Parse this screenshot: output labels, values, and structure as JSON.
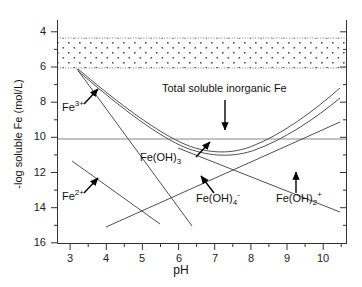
{
  "chart_data": {
    "type": "line",
    "title": "",
    "xlabel": "pH",
    "ylabel": "-log soluble Fe (mol/L)",
    "xlim": [
      2.5,
      10.7
    ],
    "ylim_inverted": true,
    "ylim": [
      4,
      16
    ],
    "grid": false,
    "legend_position": "none",
    "x_ticks": [
      3,
      4,
      5,
      6,
      7,
      8,
      9,
      10
    ],
    "x_tick_labels": [
      "3",
      "4",
      "5",
      "6",
      "7",
      "8",
      "9",
      "10"
    ],
    "x_minor_ticks": [
      2.5,
      3.5,
      4.5,
      5.5,
      6.5,
      7.5,
      8.5,
      9.5,
      10.5
    ],
    "y_ticks": [
      4,
      6,
      8,
      10,
      12,
      14,
      16
    ],
    "y_tick_labels": [
      "4",
      "6",
      "8",
      "10",
      "12",
      "14",
      "16"
    ],
    "y_minor_ticks": [
      5,
      7,
      9,
      11,
      13,
      15
    ],
    "shaded_band": {
      "label": "dotted region",
      "y_top": 4.5,
      "y_bottom": 6.2,
      "x_start": 2.5,
      "x_end": 10.7,
      "fill_pattern": "dots",
      "fill_color": "#ffffff",
      "dot_color": "#555555"
    },
    "series": [
      {
        "name": "Total soluble inorganic Fe (upper)",
        "points": [
          [
            3.1,
            6.1
          ],
          [
            4.0,
            7.25
          ],
          [
            5.0,
            8.4
          ],
          [
            6.0,
            9.3
          ],
          [
            7.0,
            10.0
          ],
          [
            7.6,
            10.25
          ],
          [
            8.0,
            10.3
          ],
          [
            8.6,
            10.0
          ],
          [
            9.2,
            9.3
          ],
          [
            9.8,
            8.4
          ],
          [
            10.4,
            7.4
          ]
        ]
      },
      {
        "name": "Total soluble inorganic Fe (lower)",
        "points": [
          [
            3.1,
            6.15
          ],
          [
            4.0,
            7.45
          ],
          [
            5.0,
            8.65
          ],
          [
            6.0,
            9.6
          ],
          [
            7.0,
            10.2
          ],
          [
            7.6,
            10.45
          ],
          [
            8.0,
            10.5
          ],
          [
            8.6,
            10.25
          ],
          [
            9.2,
            9.7
          ],
          [
            9.8,
            8.9
          ],
          [
            10.4,
            8.0
          ]
        ]
      },
      {
        "name": "Fe(3+)",
        "points": [
          [
            3.1,
            6.1
          ],
          [
            6.3,
            15.0
          ]
        ]
      },
      {
        "name": "Fe(OH)3 saturation",
        "points": [
          [
            2.5,
            10.3
          ],
          [
            10.7,
            10.3
          ]
        ]
      },
      {
        "name": "Fe(2+)",
        "points": [
          [
            3.05,
            11.3
          ],
          [
            5.5,
            14.9
          ]
        ]
      },
      {
        "name": "Fe(OH)4-",
        "points": [
          [
            4.0,
            14.95
          ],
          [
            10.4,
            9.0
          ]
        ]
      },
      {
        "name": "Fe(OH)2+",
        "points": [
          [
            6.0,
            9.6
          ],
          [
            10.4,
            13.2
          ]
        ]
      }
    ],
    "annotations": [
      {
        "id": "fe3",
        "text_html": "Fe<sup>3+</sup>",
        "label_x": 62,
        "label_y": 106,
        "arrow_from": [
          84,
          104
        ],
        "arrow_to": [
          98,
          88
        ]
      },
      {
        "id": "fe2",
        "text_html": "Fe<sup>2+</sup>",
        "label_x": 62,
        "label_y": 195,
        "arrow_from": [
          84,
          193
        ],
        "arrow_to": [
          98,
          177
        ]
      },
      {
        "id": "total",
        "text_html": "Total soluble inorganic Fe",
        "label_x": 162,
        "label_y": 88,
        "arrow_from": [
          225,
          100
        ],
        "arrow_to": [
          225,
          132
        ]
      },
      {
        "id": "feoh3",
        "text_html": "Fe(OH)<sub>3</sub>",
        "label_x": 140,
        "label_y": 158,
        "arrow_from": [
          196,
          157
        ],
        "arrow_to": [
          210,
          141
        ]
      },
      {
        "id": "feoh4",
        "text_html": "Fe(OH)<sub>4</sub><sup>-</sup>",
        "label_x": 198,
        "label_y": 197,
        "arrow_from": [
          214,
          194
        ],
        "arrow_to": [
          200,
          175
        ]
      },
      {
        "id": "feoh2",
        "text_html": "Fe(OH)<sub>2</sub><sup>+</sup>",
        "label_x": 278,
        "label_y": 197,
        "arrow_from": [
          296,
          194
        ],
        "arrow_to": [
          296,
          172
        ]
      }
    ]
  },
  "axes": {
    "x_title": "pH",
    "y_title": "-log soluble Fe (mol/L)"
  }
}
